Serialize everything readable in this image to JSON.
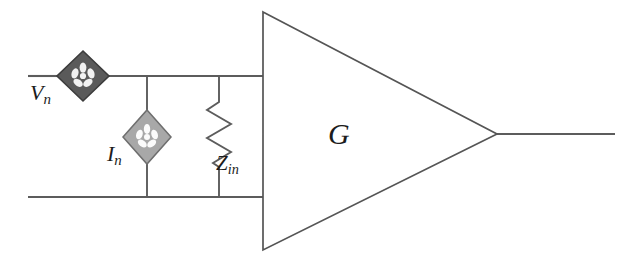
{
  "diagram": {
    "type": "circuit-schematic",
    "background_color": "#ffffff",
    "wire_color": "#5c5c5c",
    "outline_color": "#4a4a4a",
    "text_color": "#1c1c1c"
  },
  "labels": {
    "voltage_noise_source": {
      "symbol": "V",
      "subscript": "n"
    },
    "current_noise_source": {
      "symbol": "I",
      "subscript": "n"
    },
    "input_impedance": {
      "symbol": "Z",
      "subscript": "in"
    },
    "amplifier_gain": {
      "symbol": "G",
      "subscript": ""
    }
  },
  "components": [
    {
      "name": "voltage-noise-source",
      "kind": "diamond-source",
      "label": "Vn",
      "fill_color": "#5a5a5a",
      "stroke_color": "#3c3c3c",
      "glyph": "asterisk-flower-icon",
      "glyph_color": "#f2f2f2",
      "center_x": 83,
      "center_y": 76,
      "half_width": 26,
      "half_height": 25,
      "orientation": "in-series-top-rail"
    },
    {
      "name": "current-noise-source",
      "kind": "diamond-source",
      "label": "In",
      "fill_color": "#a8a8a8",
      "stroke_color": "#6e6e6e",
      "glyph": "asterisk-flower-icon",
      "glyph_color": "#fbfbfb",
      "center_x": 147,
      "center_y": 137,
      "half_width": 24,
      "half_height": 27,
      "orientation": "shunt-vertical-branch"
    },
    {
      "name": "input-impedance-resistor",
      "kind": "zigzag-resistor",
      "label": "Zin",
      "stroke_color": "#5c5c5c",
      "branch_x": 219,
      "top_y": 95,
      "bottom_y": 172,
      "zig_amplitude": 13,
      "zig_count": 6
    },
    {
      "name": "amplifier-triangle",
      "kind": "triangle-amplifier",
      "label": "G",
      "stroke_color": "#555555",
      "fill_color": "#ffffff",
      "left_x": 263,
      "top_y": 12,
      "bottom_y": 250,
      "apex_x": 497,
      "apex_y": 134
    }
  ],
  "wires": [
    {
      "name": "top-input-rail-left",
      "x1": 28,
      "y1": 76,
      "x2": 59,
      "y2": 76
    },
    {
      "name": "top-input-rail-right",
      "x1": 107,
      "y1": 76,
      "x2": 263,
      "y2": 76
    },
    {
      "name": "bottom-input-rail",
      "x1": 28,
      "y1": 197,
      "x2": 263,
      "y2": 197
    },
    {
      "name": "current-source-branch-top",
      "x1": 147,
      "y1": 76,
      "x2": 147,
      "y2": 110
    },
    {
      "name": "current-source-branch-bottom",
      "x1": 147,
      "y1": 164,
      "x2": 147,
      "y2": 197
    },
    {
      "name": "impedance-branch-top",
      "x1": 219,
      "y1": 76,
      "x2": 219,
      "y2": 95
    },
    {
      "name": "impedance-branch-bottom",
      "x1": 219,
      "y1": 172,
      "x2": 219,
      "y2": 197
    },
    {
      "name": "output-wire",
      "x1": 497,
      "y1": 134,
      "x2": 615,
      "y2": 134
    }
  ],
  "nodes": [
    {
      "name": "top-node-current-source",
      "x": 147,
      "y": 76
    },
    {
      "name": "top-node-impedance",
      "x": 219,
      "y": 76
    },
    {
      "name": "bottom-node-current-source",
      "x": 147,
      "y": 197
    },
    {
      "name": "bottom-node-impedance",
      "x": 219,
      "y": 197
    }
  ]
}
